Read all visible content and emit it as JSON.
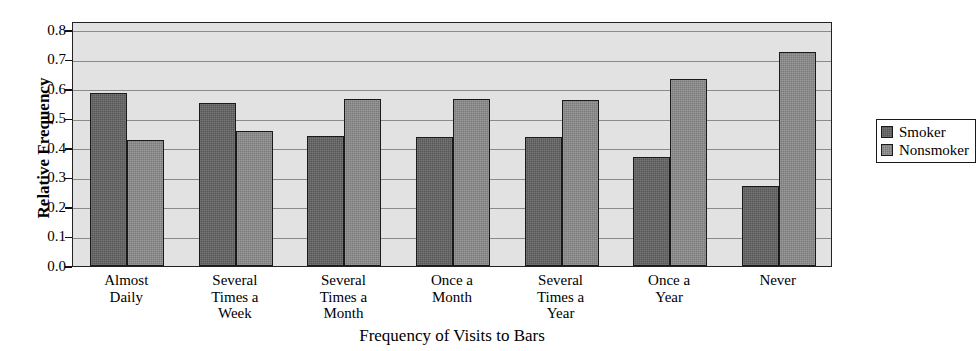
{
  "chart_data": {
    "type": "bar",
    "title": "",
    "xlabel": "Frequency of Visits to Bars",
    "ylabel": "Relative Frequency",
    "categories": [
      "Almost\nDaily",
      "Several\nTimes a\nWeek",
      "Several\nTimes a\nMonth",
      "Once a\nMonth",
      "Several\nTimes a\nYear",
      "Once a\nYear",
      "Never"
    ],
    "series": [
      {
        "name": "Smoker",
        "color": "#565656",
        "values": [
          0.585,
          0.553,
          0.44,
          0.437,
          0.437,
          0.37,
          0.272
        ]
      },
      {
        "name": "Nonsmoker",
        "color": "#7b7b7b",
        "values": [
          0.428,
          0.457,
          0.565,
          0.565,
          0.562,
          0.633,
          0.725
        ]
      }
    ],
    "ylim": [
      0.0,
      0.83
    ],
    "yticks": [
      0.0,
      0.1,
      0.2,
      0.3,
      0.4,
      0.5,
      0.6,
      0.7,
      0.8
    ],
    "ytick_labels": [
      "0.0",
      "0.1",
      "0.2",
      "0.3",
      "0.4",
      "0.5",
      "0.6",
      "0.7",
      "0.8"
    ],
    "grid": true,
    "legend_position": "right",
    "plot_background": "#e2e2e2"
  },
  "legend": {
    "entries": [
      {
        "label": "Smoker"
      },
      {
        "label": "Nonsmoker"
      }
    ]
  },
  "axes": {
    "x_title": "Frequency of Visits to Bars",
    "y_title": "Relative Frequency"
  }
}
